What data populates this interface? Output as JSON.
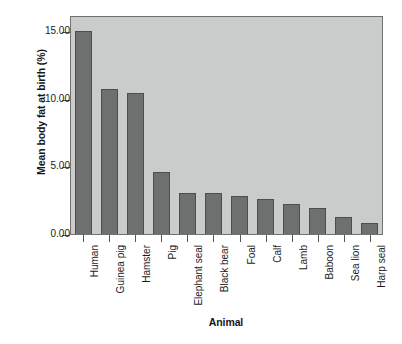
{
  "chart_data": {
    "type": "bar",
    "title": "",
    "xlabel": "Animal",
    "ylabel": "Mean body fat at birth (%)",
    "categories": [
      "Human",
      "Guinea pig",
      "Hamster",
      "Pig",
      "Elephant seal",
      "Black bear",
      "Foal",
      "Calf",
      "Lamb",
      "Baboon",
      "Sea lion",
      "Harp seal"
    ],
    "values": [
      15.0,
      10.75,
      10.4,
      4.6,
      3.0,
      3.0,
      2.8,
      2.6,
      2.25,
      1.95,
      1.25,
      0.85
    ],
    "ylim": [
      0,
      16.2
    ],
    "yticks": [
      0,
      5,
      10,
      15
    ],
    "ytick_labels": [
      "0.00",
      "5.00",
      "10.00",
      "15.00"
    ],
    "grid": false,
    "legend": null,
    "bar_color": "#6e706f",
    "bar_edge_color": "#4c4e4d",
    "plot_background": "#c9cccb",
    "figure_background": "#ffffff"
  }
}
